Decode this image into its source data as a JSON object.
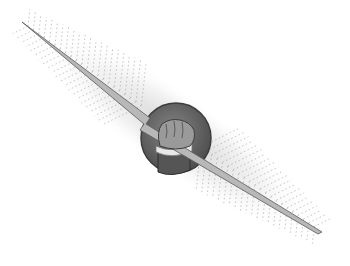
{
  "image": {
    "description": "Grayscale clip-art illustration of a fist gripping a lightning bolt in front of a dark circular disc, with feather-like radiating rays along the diagonal bolt",
    "subject": "fist holding lightning bolt",
    "colors": {
      "background": "#ffffff",
      "disc": "#6e6e6e",
      "disc_edge": "#3c3c3c",
      "bolt": "#b8b8b8",
      "bolt_edge": "#5a5a5a",
      "hand": "#9a9a9a",
      "cuff": "#e8e8e8",
      "sleeve": "#555555",
      "rays": "#9c9c9c"
    }
  }
}
